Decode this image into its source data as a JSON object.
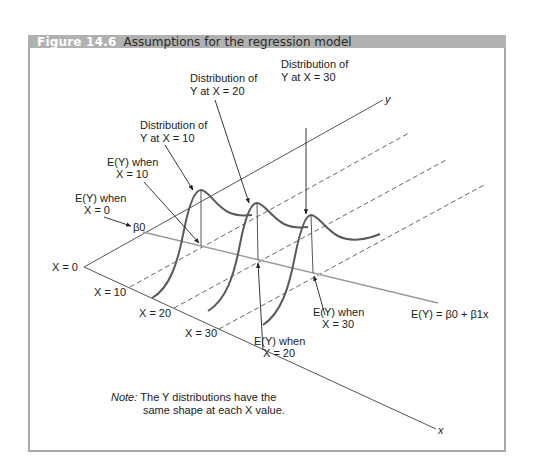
{
  "figure": {
    "number": "Figure 14.6",
    "title": "Assumptions for the regression model"
  },
  "axes": {
    "y_label": "y",
    "x_label": "x",
    "origin_label": "X = 0",
    "x_ticks": [
      "X = 10",
      "X = 20",
      "X = 30"
    ]
  },
  "labels": {
    "dist_10": [
      "Distribution of",
      "Y at X = 10"
    ],
    "dist_20": [
      "Distribution of",
      "Y at X = 20"
    ],
    "dist_30": [
      "Distribution of",
      "Y at X = 30"
    ],
    "ey_0": [
      "E(Y) when",
      "X = 0"
    ],
    "ey_10": [
      "E(Y) when",
      "X = 10"
    ],
    "ey_20": [
      "E(Y) when",
      "X = 20"
    ],
    "ey_30": [
      "E(Y) when",
      "X = 30"
    ],
    "beta0": "β0",
    "regression_line": "E(Y) = β0 + β1x"
  },
  "note": {
    "prefix": "Note:",
    "line1": "The Y distributions have the",
    "line2": "same shape at each X value."
  },
  "colors": {
    "header_bg": "#b1b1b1",
    "curve": "#5a5a5a",
    "regression_line": "#9a9a9a",
    "axis": "#555555"
  }
}
